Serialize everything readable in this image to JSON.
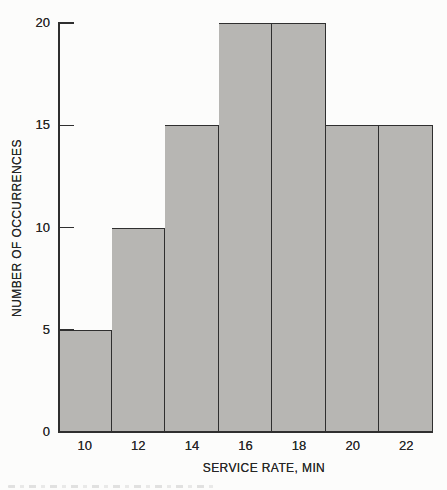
{
  "chart_data": {
    "type": "bar",
    "subtype": "histogram",
    "title": "",
    "categories": [
      10,
      12,
      14,
      16,
      18,
      20,
      22
    ],
    "values": [
      5,
      10,
      15,
      20,
      20,
      15,
      15
    ],
    "xlabel": "SERVICE RATE, MIN",
    "ylabel": "NUMBER OF OCCURRENCES",
    "ylim": [
      0,
      20
    ],
    "yticks": [
      0,
      5,
      10,
      15,
      20
    ],
    "grid": false,
    "legend": false,
    "bar_fill": "#b7b6b3",
    "bar_border": "#2f2f2f",
    "axis_color": "#2f2f2f",
    "text_color": "#262626",
    "background": "#fcfcfb"
  }
}
